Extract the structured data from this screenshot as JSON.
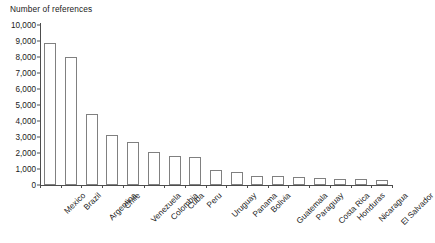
{
  "chart_data": {
    "type": "bar",
    "title": "Number of references",
    "xlabel": "",
    "ylabel": "Number of references",
    "ylim": [
      0,
      10000
    ],
    "ytick_labels": [
      "10,000",
      "9,000",
      "8,000",
      "7,000",
      "6,000",
      "5,000",
      "4,000",
      "3,000",
      "2,000",
      "1,000",
      "0"
    ],
    "ytick_values": [
      10000,
      9000,
      8000,
      7000,
      6000,
      5000,
      4000,
      3000,
      2000,
      1000,
      0
    ],
    "grid": false,
    "legend": null,
    "bar_fill_color": "#ffffff",
    "bar_edge_color": "#808080",
    "axis_color": "#4d4d4d",
    "categories": [
      "Mexico",
      "Brazil",
      "Argentina",
      "Chile",
      "Venezuela",
      "Colombia",
      "Cuba",
      "Peru",
      "Uruguay",
      "Panama",
      "Bolivia",
      "Guatemala",
      "Paraguay",
      "Costa Rica",
      "Honduras",
      "Nicaragua",
      "El Salvador"
    ],
    "values": [
      8850,
      8020,
      4420,
      3100,
      2710,
      2050,
      1790,
      1760,
      910,
      790,
      580,
      540,
      480,
      420,
      390,
      350,
      340
    ]
  }
}
